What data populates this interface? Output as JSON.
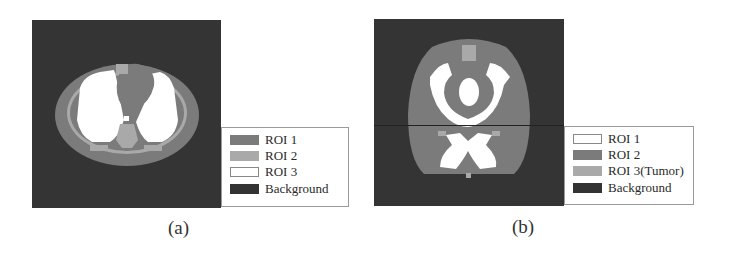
{
  "figure": {
    "panels": [
      {
        "id": "a",
        "caption": "(a)",
        "subject": "thorax-phantom",
        "legend": [
          {
            "label": "ROI 1",
            "color": "#7b7b7b"
          },
          {
            "label": "ROI 2",
            "color": "#a9a9a9"
          },
          {
            "label": "ROI 3",
            "color": "#ffffff"
          },
          {
            "label": "Background",
            "color": "#333333"
          }
        ]
      },
      {
        "id": "b",
        "caption": "(b)",
        "subject": "head-phantom",
        "legend": [
          {
            "label": "ROI 1",
            "color": "#ffffff"
          },
          {
            "label": "ROI 2",
            "color": "#7b7b7b"
          },
          {
            "label": "ROI 3(Tumor)",
            "color": "#a9a9a9"
          },
          {
            "label": "Background",
            "color": "#333333"
          }
        ]
      }
    ]
  }
}
